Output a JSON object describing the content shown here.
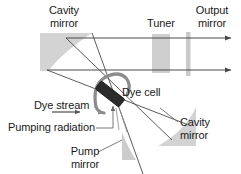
{
  "figure": {
    "kind": "optical-schematic",
    "width": 241,
    "height": 174,
    "background": "#ffffff"
  },
  "colors": {
    "background": "#ffffff",
    "mirror_fill": "#d3d3d3",
    "mirror_fill_light": "#dcdcdc",
    "tuner_fill": "#cfcfcf",
    "output_mirror_fill": "#c9c9c9",
    "dye_cell_fill": "#2b2b2b",
    "dye_cell_stroke": "#111111",
    "beam_stroke": "#4a4a4a",
    "flow_stroke": "#8c8c8c",
    "text": "#1a1a1a",
    "leader_stroke": "#5a5a5a"
  },
  "labels": {
    "cavity_mirror_top": "Cavity\nmirror",
    "tuner": "Tuner",
    "output_mirror": "Output\nmirror",
    "dye_cell": "Dye cell",
    "dye_stream": "Dye stream",
    "pumping_radiation": "Pumping radiation",
    "pump_mirror": "Pump\nmirror",
    "cavity_mirror_bottom": "Cavity\nmirror"
  },
  "components": [
    {
      "id": "cavity-mirror-top",
      "label": "Cavity mirror",
      "role": "concave end mirror of the laser cavity",
      "position": "upper left",
      "fill": "#d3d3d3"
    },
    {
      "id": "tuner",
      "label": "Tuner",
      "role": "intracavity wavelength selective element",
      "position": "upper center-right",
      "fill": "#cfcfcf"
    },
    {
      "id": "output-mirror",
      "label": "Output mirror",
      "role": "partially transmitting output coupler",
      "position": "upper right",
      "fill": "#c9c9c9"
    },
    {
      "id": "dye-cell",
      "label": "Dye cell",
      "role": "tilted gain medium jet cell",
      "position": "center",
      "fill": "#2b2b2b"
    },
    {
      "id": "dye-stream",
      "label": "Dye stream",
      "role": "flowing dye solution through the cell",
      "position": "center left",
      "fill": "#8c8c8c"
    },
    {
      "id": "pumping-radiation",
      "label": "Pumping radiation",
      "role": "external pump beam entering from below",
      "position": "lower left",
      "fill": "none"
    },
    {
      "id": "pump-mirror",
      "label": "Pump mirror",
      "role": "focuses pump radiation onto the dye cell",
      "position": "lower center",
      "fill": "#d3d3d3"
    },
    {
      "id": "cavity-mirror-bottom",
      "label": "Cavity mirror",
      "role": "concave folding mirror of the laser cavity",
      "position": "lower right",
      "fill": "#d3d3d3"
    }
  ],
  "beams": [
    {
      "id": "cavity-beam-upper",
      "description": "horizontal intracavity beam, upper arm, exits right",
      "direction": "left-to-right"
    },
    {
      "id": "cavity-beam-lower",
      "description": "horizontal intracavity beam, lower arm, exits right",
      "direction": "left-to-right"
    },
    {
      "id": "fold-beam-a",
      "description": "diagonal folded beam from upper-left mirror through dye cell toward lower right",
      "direction": "diagonal"
    },
    {
      "id": "fold-beam-b",
      "description": "diagonal folded beam from upper arm through dye cell toward lower-right cavity mirror",
      "direction": "diagonal"
    },
    {
      "id": "pump-beam",
      "description": "pump radiation reflected up from pump mirror into dye cell",
      "direction": "upward"
    }
  ]
}
